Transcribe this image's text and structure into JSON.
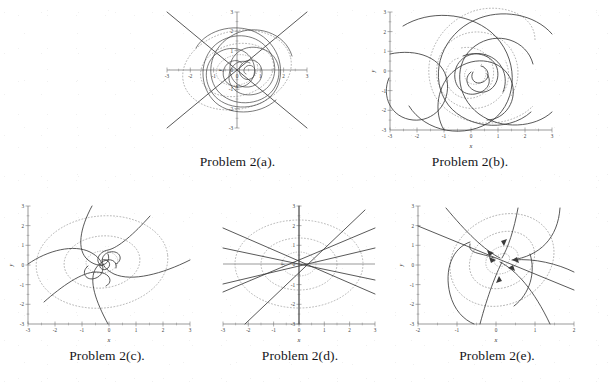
{
  "figure": {
    "background_color": "#ffffff",
    "ink_color": "#3b3b3b",
    "dashed_color": "#8a8a8a",
    "panels": [
      {
        "id": "a",
        "caption": "Problem 2(a).",
        "axis": {
          "xlabel": "x",
          "ylabel": "y",
          "xlim": [
            -3,
            3
          ],
          "ylim": [
            -3,
            3
          ],
          "xticks": [
            "-3",
            "-2",
            "-1",
            "0",
            "1",
            "2",
            "3"
          ],
          "yticks": [
            "-3",
            "-2",
            "-1",
            "0",
            "1",
            "2",
            "3"
          ],
          "xtick_values": [
            -3,
            -2,
            -1,
            0,
            1,
            2,
            3
          ],
          "ytick_values": [
            -3,
            -2,
            -1,
            0,
            1,
            2,
            3
          ]
        },
        "portrait_type": "stable-spiral",
        "description": "Tight inward spiral at origin with two straight eigen-direction lines crossing the field and dashed elliptical level curves."
      },
      {
        "id": "b",
        "caption": "Problem 2(b).",
        "axis": {
          "xlabel": "x",
          "ylabel": "y",
          "xlim": [
            -3,
            3
          ],
          "ylim": [
            -3,
            3
          ],
          "xticks": [
            "-3",
            "-2",
            "-1",
            "0",
            "1",
            "2",
            "3"
          ],
          "yticks": [
            "-3",
            "-2",
            "-1",
            "0",
            "1",
            "2",
            "3"
          ],
          "xtick_values": [
            -3,
            -2,
            -1,
            0,
            1,
            2,
            3
          ],
          "ytick_values": [
            -3,
            -2,
            -1,
            0,
            1,
            2,
            3
          ]
        },
        "portrait_type": "spiral",
        "description": "Broad counter-clockwise spiral arms winding out from the origin, overlaid by dashed spiral level curves."
      },
      {
        "id": "c",
        "caption": "Problem 2(c).",
        "axis": {
          "xlabel": "x",
          "ylabel": "y",
          "xlim": [
            -3,
            3
          ],
          "ylim": [
            -3,
            3
          ],
          "xticks": [
            "-3",
            "-2",
            "-1",
            "0",
            "1",
            "2",
            "3"
          ],
          "yticks": [
            "-3",
            "-2",
            "-1",
            "0",
            "1",
            "2",
            "3"
          ],
          "xtick_values": [
            -3,
            -2,
            -1,
            0,
            1,
            2,
            3
          ],
          "ytick_values": [
            -3,
            -2,
            -1,
            0,
            1,
            2,
            3
          ]
        },
        "portrait_type": "spiral",
        "description": "Five spiral arms converging on the origin, with two concentric dashed ellipses."
      },
      {
        "id": "d",
        "caption": "Problem 2(d).",
        "axis": {
          "xlabel": "x",
          "ylabel": "y",
          "xlim": [
            -3,
            3
          ],
          "ylim": [
            -3,
            3
          ],
          "xticks": [
            "-3",
            "-2",
            "-1",
            "0",
            "1",
            "2",
            "3"
          ],
          "yticks": [
            "-3",
            "-2",
            "-1",
            "0",
            "1",
            "2",
            "3"
          ],
          "xtick_values": [
            -3,
            -2,
            -1,
            0,
            1,
            2,
            3
          ],
          "ytick_values": [
            -3,
            -2,
            -1,
            0,
            1,
            2,
            3
          ]
        },
        "portrait_type": "star-node",
        "description": "Straight-line trajectories radiating from the origin in all directions with three concentric dashed ellipses."
      },
      {
        "id": "e",
        "caption": "Problem 2(e).",
        "axis": {
          "xlabel": "x",
          "ylabel": "y",
          "xlim": [
            -2,
            2
          ],
          "ylim": [
            -3,
            3
          ],
          "xticks": [
            "-2",
            "-1",
            "0",
            "1",
            "2"
          ],
          "yticks": [
            "-3",
            "-2",
            "-1",
            "0",
            "1",
            "2",
            "3"
          ],
          "xtick_values": [
            -2,
            -1,
            0,
            1,
            2
          ],
          "ytick_values": [
            -3,
            -2,
            -1,
            0,
            1,
            2,
            3
          ]
        },
        "portrait_type": "improper-node",
        "description": "Skewed trajectories with arrowheads approaching the origin along a dominant direction, with dashed elliptical level curves."
      }
    ]
  }
}
